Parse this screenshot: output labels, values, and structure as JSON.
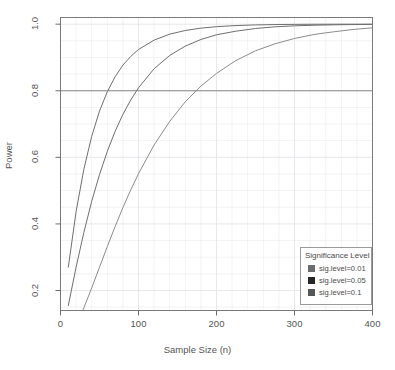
{
  "chart_data": {
    "type": "line",
    "title": "",
    "xlabel": "Sample Size (n)",
    "ylabel": "Power",
    "xlim": [
      0,
      400
    ],
    "ylim": [
      0.14,
      1.02
    ],
    "xticks": [
      0,
      100,
      200,
      300,
      400
    ],
    "xtick_labels": [
      "0",
      "100",
      "200",
      "300",
      "400"
    ],
    "yticks": [
      0.2,
      0.4,
      0.6,
      0.8,
      1.0
    ],
    "ytick_labels": [
      "0.2",
      "0.4",
      "0.6",
      "0.8",
      "1.0"
    ],
    "grid": true,
    "legend_position": "bottom-right",
    "reference_lines": [
      {
        "name": "power-threshold",
        "orientation": "horizontal",
        "y": 0.8,
        "color": "#8a8a8a"
      }
    ],
    "x": [
      10,
      20,
      30,
      40,
      50,
      60,
      70,
      80,
      90,
      100,
      120,
      140,
      160,
      180,
      200,
      225,
      250,
      275,
      300,
      325,
      350,
      375,
      400
    ],
    "series": [
      {
        "name": "sig.level=0.01",
        "color": "#6f6f6f",
        "values": [
          0.155,
          0.27,
          0.375,
          0.468,
          0.548,
          0.618,
          0.678,
          0.729,
          0.772,
          0.809,
          0.866,
          0.906,
          0.934,
          0.954,
          0.968,
          0.979,
          0.987,
          0.992,
          0.995,
          0.9968,
          0.998,
          0.9988,
          0.9993
        ]
      },
      {
        "name": "sig.level=0.05",
        "color": "#6f6f6f",
        "values": [
          0.27,
          0.437,
          0.565,
          0.663,
          0.739,
          0.797,
          0.842,
          0.877,
          0.903,
          0.924,
          0.952,
          0.97,
          0.981,
          0.988,
          0.9925,
          0.9958,
          0.9977,
          0.9988,
          0.9993,
          0.9997,
          0.9998,
          0.9999,
          0.99995
        ]
      },
      {
        "name": "sig.level=0.1",
        "color": "#8c8c8c",
        "values": [
          0.052,
          0.095,
          0.148,
          0.208,
          0.27,
          0.332,
          0.392,
          0.449,
          0.502,
          0.551,
          0.637,
          0.708,
          0.767,
          0.814,
          0.852,
          0.891,
          0.92,
          0.941,
          0.957,
          0.969,
          0.977,
          0.984,
          0.989
        ]
      }
    ]
  },
  "legend": {
    "title": "Significance Level",
    "entries": [
      {
        "label": "sig.level=0.01",
        "color": "#6b6b6b"
      },
      {
        "label": "sig.level=0.05",
        "color": "#262626"
      },
      {
        "label": "sig.level=0.1",
        "color": "#575757"
      }
    ]
  },
  "colors": {
    "axis": "#6b6b6b",
    "frame": "#7a7a7a",
    "grid": "#e4e4ea",
    "text": "#4a4a4a",
    "background": "#ffffff"
  }
}
